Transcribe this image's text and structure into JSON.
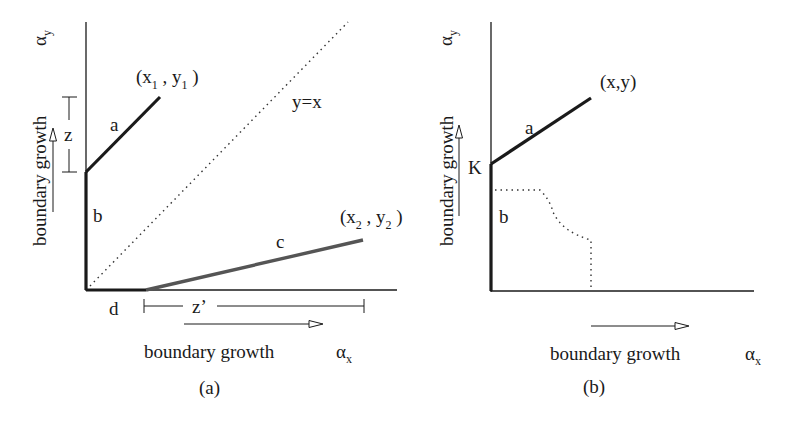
{
  "figure": {
    "panels": [
      {
        "id": "a",
        "caption": "(a)",
        "y_axis_symbol": "α",
        "y_axis_symbol_sub": "y",
        "y_axis_label": "boundary growth",
        "x_axis_symbol": "α",
        "x_axis_symbol_sub": "x",
        "x_axis_label": "boundary growth",
        "diagonal_label": "y=x",
        "segment_labels": {
          "a": "a",
          "b": "b",
          "c": "c",
          "d": "d"
        },
        "bracket_labels": {
          "z": "z",
          "z_prime": "z’"
        },
        "point1": {
          "open": "(x",
          "sub_x": "1",
          "mid": " , y",
          "sub_y": "1",
          "close": " )"
        },
        "point2": {
          "open": "(x",
          "sub_x": "2",
          "mid": " , y",
          "sub_y": "2",
          "close": " )"
        }
      },
      {
        "id": "b",
        "caption": "(b)",
        "y_axis_symbol": "α",
        "y_axis_symbol_sub": "y",
        "y_axis_label": "boundary growth",
        "x_axis_symbol": "α",
        "x_axis_symbol_sub": "x",
        "x_axis_label": "boundary growth",
        "segment_labels": {
          "a": "a",
          "b": "b"
        },
        "k_label": "K",
        "point": "(x,y)"
      }
    ],
    "colors": {
      "line": "#1a1a1a",
      "segment_c": "#555555",
      "dotted": "#333333"
    }
  }
}
